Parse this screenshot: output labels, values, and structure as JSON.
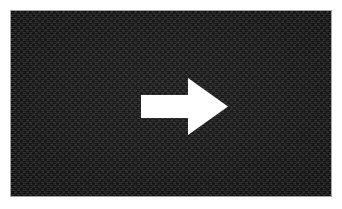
{
  "canvas": {
    "width": 342,
    "height": 209,
    "background_color": "#ffffff",
    "title": "Right arrow on dark textured panel"
  },
  "panel": {
    "name": "dark-textured-panel",
    "x": 11,
    "y": 11,
    "width": 320,
    "height": 185,
    "base_color": "#232323",
    "dark_color": "#121212",
    "light_color": "#3a3a3a",
    "texture": "woven-checkerboard",
    "cell_size_px": 3,
    "border_color": "#0d0d0d"
  },
  "arrow": {
    "name": "right-arrow",
    "direction": "right",
    "fill_color": "#ffffff",
    "shaft": {
      "x": 141,
      "y": 95,
      "width": 47,
      "height": 23
    },
    "head": {
      "x": 188,
      "y_top": 78,
      "y_bottom": 135,
      "tip_x": 228,
      "tip_y": 106.5,
      "width": 40,
      "height": 57
    },
    "points": "141,95 188,95 188,78 228,106.5 188,135 188,118 141,118",
    "bounding_box": {
      "x": 141,
      "y": 78,
      "width": 87,
      "height": 57
    }
  },
  "margins": {
    "top": 11,
    "right": 11,
    "bottom": 13,
    "left": 11
  }
}
